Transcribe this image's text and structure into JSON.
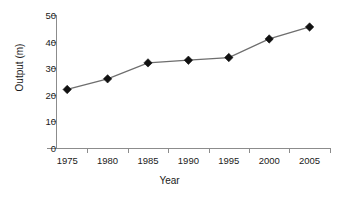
{
  "chart_data": {
    "type": "line",
    "title": "",
    "xlabel": "Year",
    "ylabel": "Output (m)",
    "categories": [
      "1975",
      "1980",
      "1985",
      "1990",
      "1995",
      "2000",
      "2005"
    ],
    "values": [
      22,
      26,
      32,
      33,
      34,
      41,
      45.5
    ],
    "series": [
      {
        "name": "Output",
        "values": [
          22,
          26,
          32,
          33,
          34,
          41,
          45.5
        ]
      }
    ],
    "y_ticks": [
      "0",
      "10",
      "20",
      "30",
      "40",
      "50"
    ],
    "y_tick_values": [
      0,
      10,
      20,
      30,
      40,
      50
    ],
    "ylim": [
      0,
      50
    ],
    "grid": false,
    "legend": false,
    "marker": "diamond",
    "marker_color": "#111111",
    "line_color": "#6e6e6e",
    "axis_color": "#8c8c8c",
    "background": "#ffffff"
  }
}
